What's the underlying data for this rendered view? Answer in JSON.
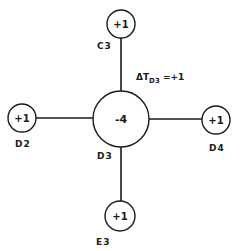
{
  "diagram": {
    "center": {
      "id": "D3",
      "value": "-4",
      "cell_label": "D3"
    },
    "neighbors": [
      {
        "id": "C3",
        "position": "top",
        "value": "+1",
        "cell_label": "C3"
      },
      {
        "id": "D2",
        "position": "left",
        "value": "+1",
        "cell_label": "D2"
      },
      {
        "id": "D4",
        "position": "right",
        "value": "+1",
        "cell_label": "D4"
      },
      {
        "id": "E3",
        "position": "bottom",
        "value": "+1",
        "cell_label": "E3"
      }
    ],
    "annotation": {
      "prefix": "ΔT",
      "subscript": "D3",
      "suffix": " =+1"
    },
    "colors": {
      "stroke": "#1a1a1a",
      "background": "#ffffff"
    }
  }
}
